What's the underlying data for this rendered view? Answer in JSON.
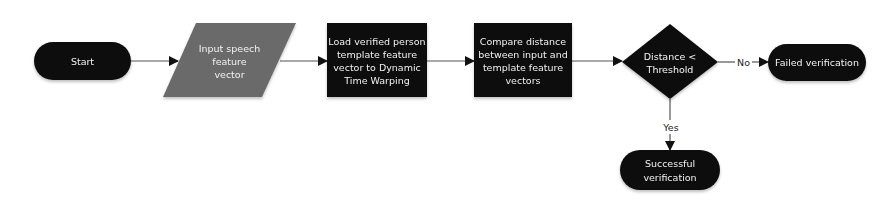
{
  "diagram": {
    "type": "flowchart",
    "colors": {
      "terminal_fill": "#0f0f0f",
      "process_fill": "#0a0a0a",
      "decision_fill": "#111111",
      "io_fill": "#6b6b6b",
      "edge": "#555555",
      "label_text": "#f2f2f2",
      "edge_label_text": "#222222"
    },
    "nodes": {
      "start": {
        "shape": "terminal",
        "lines": [
          "Start"
        ]
      },
      "input": {
        "shape": "parallelogram",
        "lines": [
          "Input speech",
          "feature",
          "vector"
        ]
      },
      "load": {
        "shape": "process",
        "lines": [
          "Load verified person",
          "template feature",
          "vector to Dynamic",
          "Time Warping"
        ]
      },
      "compare": {
        "shape": "process",
        "lines": [
          "Compare distance",
          "between input and",
          "template feature",
          "vectors"
        ]
      },
      "decision": {
        "shape": "decision",
        "lines": [
          "Distance <",
          "Threshold"
        ]
      },
      "failed": {
        "shape": "terminal",
        "lines": [
          "Failed verification"
        ]
      },
      "success": {
        "shape": "terminal",
        "lines": [
          "Successful",
          "verification"
        ]
      }
    },
    "edges": {
      "start_to_input": {
        "from": "start",
        "to": "input",
        "label": ""
      },
      "input_to_load": {
        "from": "input",
        "to": "load",
        "label": ""
      },
      "load_to_compare": {
        "from": "load",
        "to": "compare",
        "label": ""
      },
      "compare_to_decision": {
        "from": "compare",
        "to": "decision",
        "label": ""
      },
      "decision_no": {
        "from": "decision",
        "to": "failed",
        "label": "No"
      },
      "decision_yes": {
        "from": "decision",
        "to": "success",
        "label": "Yes"
      }
    }
  }
}
